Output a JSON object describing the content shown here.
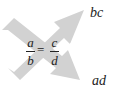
{
  "diagram": {
    "type": "cross-multiplication",
    "arrow_color": "#d2d2d2",
    "equation": {
      "left": {
        "numerator": "a",
        "denominator": "b"
      },
      "operator": "=",
      "right": {
        "numerator": "c",
        "denominator": "d"
      }
    },
    "products": {
      "top_right": "bc",
      "bottom_right": "ad"
    }
  }
}
